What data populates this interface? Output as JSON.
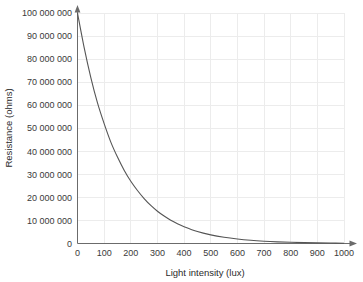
{
  "chart_data": {
    "type": "line",
    "title": "",
    "xlabel": "Light intensity (lux)",
    "ylabel": "Resistance (ohms)",
    "xlim": [
      0,
      1000
    ],
    "ylim": [
      0,
      100000000
    ],
    "grid": true,
    "legend": "none",
    "x_ticks": [
      0,
      100,
      200,
      300,
      400,
      500,
      600,
      700,
      800,
      900,
      1000
    ],
    "x_tick_labels": [
      "0",
      "100",
      "200",
      "300",
      "400",
      "500",
      "600",
      "700",
      "800",
      "900",
      "1000"
    ],
    "y_ticks": [
      0,
      10000000,
      20000000,
      30000000,
      40000000,
      50000000,
      60000000,
      70000000,
      80000000,
      90000000,
      100000000
    ],
    "y_tick_labels": [
      "0",
      "10 000 000",
      "20 000 000",
      "30 000 000",
      "40 000 000",
      "50 000 000",
      "60 000 000",
      "70 000 000",
      "80 000 000",
      "90 000 000",
      "100 000 000"
    ],
    "series": [
      {
        "name": "LDR resistance",
        "color": "#555555",
        "x": [
          0,
          25,
          50,
          75,
          100,
          125,
          150,
          175,
          200,
          225,
          250,
          275,
          300,
          325,
          350,
          375,
          400,
          450,
          500,
          550,
          600,
          650,
          700,
          750,
          800,
          850,
          900,
          950,
          1000
        ],
        "y": [
          100000000,
          85000000,
          72000000,
          61000000,
          52000000,
          44000000,
          37500000,
          31800000,
          27000000,
          23000000,
          19500000,
          16500000,
          14000000,
          11900000,
          10100000,
          8600000,
          7300000,
          5200000,
          3750000,
          2700000,
          1950000,
          1400000,
          1000000,
          720000,
          520000,
          370000,
          270000,
          190000,
          140000
        ]
      }
    ],
    "annotations": [
      {
        "name": "x-axis-arrowhead",
        "desc": "arrow at right end of x axis"
      },
      {
        "name": "y-axis-arrowhead",
        "desc": "arrow at top end of y axis"
      }
    ]
  }
}
